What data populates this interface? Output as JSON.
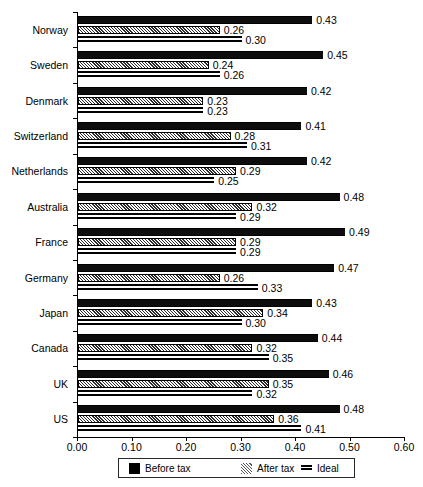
{
  "chart_data": {
    "type": "bar",
    "orientation": "horizontal",
    "title": "",
    "xlabel": "",
    "ylabel": "",
    "xlim": [
      0.0,
      0.6
    ],
    "xticks": [
      "0.00",
      "0.10",
      "0.20",
      "0.30",
      "0.40",
      "0.50",
      "0.60"
    ],
    "xtick_values": [
      0.0,
      0.1,
      0.2,
      0.3,
      0.4,
      0.5,
      0.6
    ],
    "grid": false,
    "legend_position": "bottom",
    "categories": [
      "Norway",
      "Sweden",
      "Denmark",
      "Switzerland",
      "Netherlands",
      "Australia",
      "France",
      "Germany",
      "Japan",
      "Canada",
      "UK",
      "US"
    ],
    "series": [
      {
        "name": "Before tax",
        "pattern": "solid-black",
        "color": "#000000",
        "values": [
          0.43,
          0.45,
          0.42,
          0.41,
          0.42,
          0.48,
          0.49,
          0.47,
          0.43,
          0.44,
          0.46,
          0.48
        ],
        "labels": [
          "0.43",
          "0.45",
          "0.42",
          "0.41",
          "0.42",
          "0.48",
          "0.49",
          "0.47",
          "0.43",
          "0.44",
          "0.46",
          "0.48"
        ]
      },
      {
        "name": "After tax",
        "pattern": "checkered-hatch",
        "color": "#808080",
        "values": [
          0.26,
          0.24,
          0.23,
          0.28,
          0.29,
          0.32,
          0.29,
          0.26,
          0.34,
          0.32,
          0.35,
          0.36
        ],
        "labels": [
          "0.26",
          "0.24",
          "0.23",
          "0.28",
          "0.29",
          "0.32",
          "0.29",
          "0.26",
          "0.34",
          "0.32",
          "0.35",
          "0.36"
        ]
      },
      {
        "name": "Ideal",
        "pattern": "horizontal-lines",
        "color": "#000000",
        "values": [
          0.3,
          0.26,
          0.23,
          0.31,
          0.25,
          0.29,
          0.29,
          0.33,
          0.3,
          0.35,
          0.32,
          0.41
        ],
        "labels": [
          "0.30",
          "0.26",
          "0.23",
          "0.31",
          "0.25",
          "0.29",
          "0.29",
          "0.33",
          "0.30",
          "0.35",
          "0.32",
          "0.41"
        ]
      }
    ]
  },
  "legend": {
    "items": [
      {
        "label": "Before tax",
        "swatch": "solid-square-black"
      },
      {
        "label": "After tax",
        "swatch": "checkered-square"
      },
      {
        "label": "Ideal",
        "swatch": "horizontal-lines-square"
      }
    ]
  }
}
